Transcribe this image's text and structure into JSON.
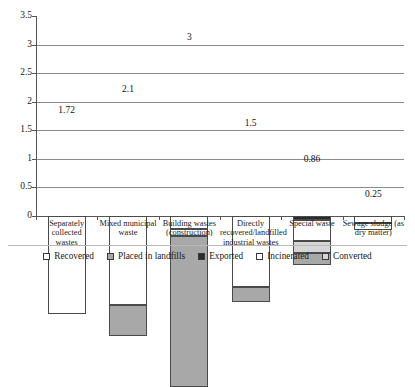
{
  "chart_data": {
    "type": "bar",
    "subtype": "stacked",
    "title": "",
    "subtitle": "",
    "xlabel": "",
    "ylabel": "",
    "ylim": [
      0,
      3.5
    ],
    "yticks": [
      "0",
      "0.5",
      "1",
      "1.5",
      "2",
      "2.5",
      "3",
      "3.5"
    ],
    "ytick_values": [
      0,
      0.5,
      1,
      1.5,
      2,
      2.5,
      3,
      3.5
    ],
    "grid": true,
    "grid_axis": "y",
    "legend_position": "bottom",
    "categories": [
      "Separately collected wastes",
      "Mixed municipal waste",
      "Building wastes (construction)",
      "Directly recovered/landfilled industrial wastes",
      "Special waste",
      "Sewage sludge (as dry matter)"
    ],
    "totals": [
      1.72,
      2.1,
      3,
      1.5,
      0.86,
      0.25
    ],
    "total_labels": [
      "1.72",
      "2.1",
      "3",
      "1.5",
      "0.86",
      "0.25"
    ],
    "series": [
      {
        "name": "Recovered",
        "color": "#ffffff",
        "values": [
          1.72,
          1.56,
          0.22,
          1.25,
          0.0,
          0.13
        ]
      },
      {
        "name": "Placed in landfills",
        "color": "#a8a8a8",
        "values": [
          0.0,
          0.54,
          2.65,
          0.25,
          0.22,
          0.0
        ]
      },
      {
        "name": "Exported",
        "color": "#2b2b2b",
        "values": [
          0.0,
          0.0,
          0.0,
          0.0,
          0.07,
          0.0
        ]
      },
      {
        "name": "Incinerated",
        "color": "#ffffff",
        "values": [
          0.0,
          0.0,
          0.13,
          0.0,
          0.36,
          0.12
        ]
      },
      {
        "name": "Converted",
        "color": "#d5d5d5",
        "values": [
          0.0,
          0.0,
          0.0,
          0.0,
          0.21,
          0.0
        ]
      }
    ],
    "stack_order_bottom_to_top": [
      [
        "Recovered"
      ],
      [
        "Placed in landfills",
        "Recovered"
      ],
      [
        "Placed in landfills",
        "Incinerated",
        "Recovered"
      ],
      [
        "Placed in landfills",
        "Recovered"
      ],
      [
        "Placed in landfills",
        "Converted",
        "Incinerated",
        "Exported"
      ],
      [
        "Recovered",
        "Incinerated"
      ]
    ]
  },
  "legend": {
    "items": [
      {
        "label": "Recovered",
        "swatch": "white-swatch"
      },
      {
        "label": "Placed in landfills",
        "swatch": "light-gray-swatch"
      },
      {
        "label": "Exported",
        "swatch": "black-swatch"
      },
      {
        "label": "Incinerated",
        "swatch": "white-swatch"
      },
      {
        "label": "Converted",
        "swatch": "pale-gray-swatch"
      }
    ]
  },
  "axis": {
    "y_labels": [
      "3.5",
      "3",
      "2.5",
      "2",
      "1.5",
      "1",
      "0.5",
      "0"
    ]
  },
  "categories_display": [
    {
      "line1": "Separately collected",
      "line2": "wastes",
      "line3": ""
    },
    {
      "line1": "Mixed municipal",
      "line2": "waste",
      "line3": ""
    },
    {
      "line1": "Building wastes",
      "line2": "(construction)",
      "line3": ""
    },
    {
      "line1": "Directly",
      "line2": "recovered/landfilled",
      "line3": "industrial wastes"
    },
    {
      "line1": "Special waste",
      "line2": "",
      "line3": ""
    },
    {
      "line1": "Sewage sludge (as",
      "line2": "dry matter)",
      "line3": ""
    }
  ],
  "values_display": [
    "1.72",
    "2.1",
    "3",
    "1.5",
    "0.86",
    "0.25"
  ]
}
